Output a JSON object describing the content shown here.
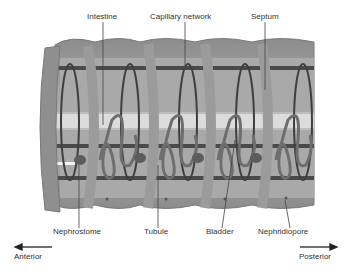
{
  "labels": {
    "top": [
      {
        "text": "Intestine",
        "x": 87,
        "y": 18
      },
      {
        "text": "Capillary network",
        "x": 150,
        "y": 18
      },
      {
        "text": "Septum",
        "x": 251,
        "y": 18
      }
    ],
    "bottom": [
      {
        "text": "Nephrostome",
        "x": 53,
        "y": 232
      },
      {
        "text": "Tubule",
        "x": 144,
        "y": 232
      },
      {
        "text": "Bladder",
        "x": 206,
        "y": 232
      },
      {
        "text": "Nephridiopore",
        "x": 258,
        "y": 232
      }
    ],
    "direction": [
      {
        "text": "Anterior",
        "x": 14,
        "y": 256
      },
      {
        "text": "Posterior",
        "x": 299,
        "y": 256
      }
    ]
  },
  "colors": {
    "body_outer": "#8a8a8a",
    "body_inner": "#a8a8a8",
    "septum": "#9a9a9a",
    "intestine": "#d8d8d8",
    "vessel": "#4a4a4a",
    "tubule": "#6e6e6e",
    "text": "#333333"
  }
}
